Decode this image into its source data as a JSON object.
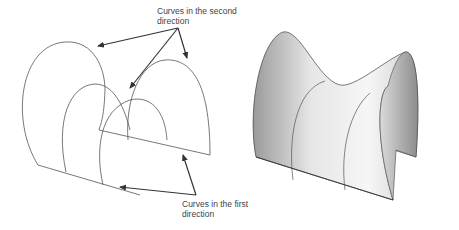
{
  "diagram": {
    "labels": {
      "second_direction_line1": "Curves in the second",
      "second_direction_line2": "direction",
      "first_direction_line1": "Curves in the first",
      "first_direction_line2": "direction"
    },
    "panels": [
      "wireframe-curves",
      "shaded-surface"
    ],
    "colors": {
      "line": "#555555",
      "arrow": "#333333",
      "surface_light": "#f4f4f4",
      "surface_dark": "#9a9a9a"
    }
  }
}
